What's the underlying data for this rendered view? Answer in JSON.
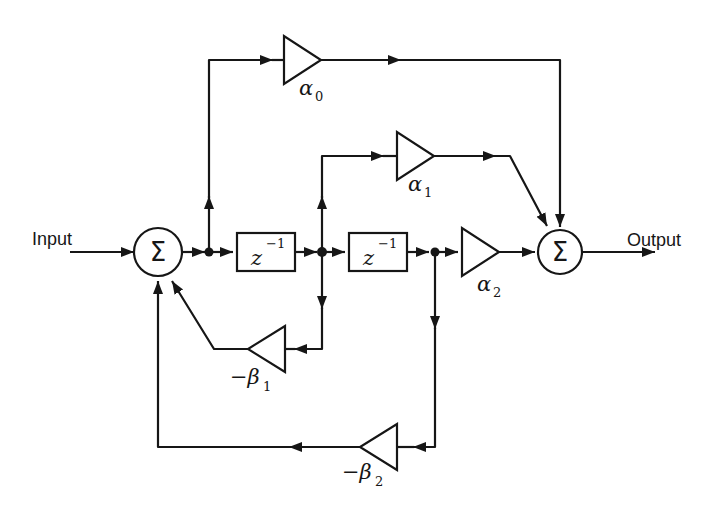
{
  "io": {
    "input": "Input",
    "output": "Output"
  },
  "summers": {
    "left": "Σ",
    "right": "Σ"
  },
  "delays": {
    "d1": {
      "base": "z",
      "sup": "−1"
    },
    "d2": {
      "base": "z",
      "sup": "−1"
    }
  },
  "gains": {
    "a0": {
      "base": "α",
      "sub": "0"
    },
    "a1": {
      "base": "α",
      "sub": "1"
    },
    "a2": {
      "base": "α",
      "sub": "2"
    },
    "b1": {
      "base": "−β",
      "sub": "1"
    },
    "b2": {
      "base": "−β",
      "sub": "2"
    }
  },
  "colors": {
    "line": "#161616",
    "background": "#ffffff"
  }
}
